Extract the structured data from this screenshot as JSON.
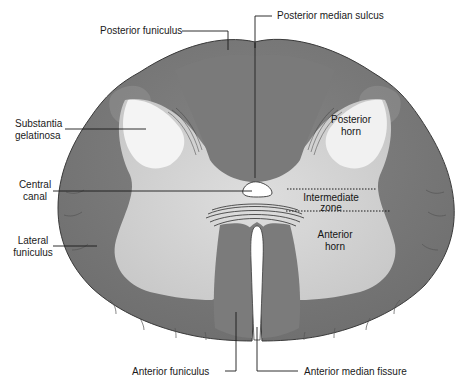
{
  "diagram": {
    "colors": {
      "white_matter": "#7d7d7d",
      "white_matter_dark": "#6e6e6e",
      "gray_matter": "#d6d6d6",
      "substantia_gelatinosa": "#f3f3f3",
      "outline": "#3a3a3a",
      "background": "#ffffff",
      "label_text": "#1a1a1a"
    },
    "labels": {
      "posterior_funiculus": "Posterior funiculus",
      "posterior_median_sulcus": "Posterior median sulcus",
      "substantia_gelatinosa_1": "Substantia",
      "substantia_gelatinosa_2": "gelatinosa",
      "posterior_horn_1": "Posterior",
      "posterior_horn_2": "horn",
      "central_canal_1": "Central",
      "central_canal_2": "canal",
      "intermediate_zone_1": "Intermediate",
      "intermediate_zone_2": "zone",
      "lateral_funiculus_1": "Lateral",
      "lateral_funiculus_2": "funiculus",
      "anterior_horn_1": "Anterior",
      "anterior_horn_2": "horn",
      "anterior_funiculus": "Anterior funiculus",
      "anterior_median_fissure": "Anterior median fissure"
    }
  }
}
